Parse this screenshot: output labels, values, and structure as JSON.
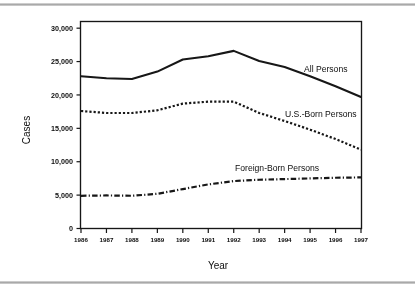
{
  "chart_data": {
    "type": "line",
    "title": "",
    "xlabel": "Year",
    "ylabel": "Cases",
    "x": [
      1986,
      1987,
      1988,
      1989,
      1990,
      1991,
      1992,
      1993,
      1994,
      1995,
      1996,
      1997
    ],
    "categories": [
      "1986",
      "1987",
      "1988",
      "1989",
      "1990",
      "1991",
      "1992",
      "1993",
      "1994",
      "1995",
      "1996",
      "1997"
    ],
    "xlim": [
      1986,
      1997
    ],
    "ylim": [
      0,
      31000
    ],
    "yticks": [
      0,
      5000,
      10000,
      15000,
      20000,
      25000,
      30000
    ],
    "ytick_labels": [
      "0",
      "5,000",
      "10,000",
      "15,000",
      "20,000",
      "25,000",
      "30,000"
    ],
    "grid": false,
    "legend_position": "inline-right",
    "series": [
      {
        "name": "All Persons",
        "style": "solid",
        "label_text": "All Persons",
        "values": [
          22800,
          22500,
          22400,
          23500,
          25300,
          25800,
          26600,
          25100,
          24200,
          22800,
          21300,
          19700
        ]
      },
      {
        "name": "U.S.-Born Persons",
        "style": "dotted",
        "label_text": "U.S.-Born Persons",
        "values": [
          17600,
          17300,
          17300,
          17700,
          18700,
          19000,
          19000,
          17300,
          16100,
          14800,
          13400,
          11800
        ]
      },
      {
        "name": "Foreign-Born Persons",
        "style": "dash-dot",
        "label_text": "Foreign-Born Persons",
        "values": [
          4900,
          4950,
          4900,
          5200,
          5900,
          6600,
          7100,
          7300,
          7400,
          7500,
          7600,
          7650
        ]
      }
    ]
  },
  "axes": {
    "y_title": "Cases",
    "x_title": "Year"
  }
}
